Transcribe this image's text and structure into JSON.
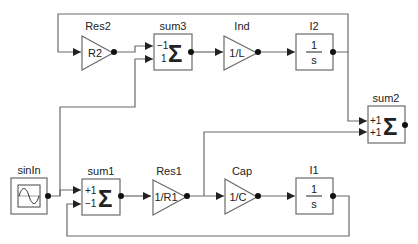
{
  "diagram": {
    "type": "block-diagram",
    "blocks": [
      {
        "id": "res2",
        "label": "Res2",
        "kind": "gain",
        "text": "R2"
      },
      {
        "id": "sum3",
        "label": "sum3",
        "kind": "sum",
        "ports": [
          "−1",
          "1"
        ],
        "symbol": "Σ"
      },
      {
        "id": "ind",
        "label": "Ind",
        "kind": "gain",
        "text": "1/L"
      },
      {
        "id": "i2",
        "label": "I2",
        "kind": "integrator",
        "num": "1",
        "den": "s"
      },
      {
        "id": "sum2",
        "label": "sum2",
        "kind": "sum",
        "ports": [
          "+1",
          "+1"
        ],
        "symbol": "Σ"
      },
      {
        "id": "sinin",
        "label": "sinIn",
        "kind": "source"
      },
      {
        "id": "sum1",
        "label": "sum1",
        "kind": "sum",
        "ports": [
          "+1",
          "−1"
        ],
        "symbol": "Σ"
      },
      {
        "id": "res1",
        "label": "Res1",
        "kind": "gain",
        "text": "1/R1"
      },
      {
        "id": "cap",
        "label": "Cap",
        "kind": "gain",
        "text": "1/C"
      },
      {
        "id": "i1",
        "label": "I1",
        "kind": "integrator",
        "num": "1",
        "den": "s"
      }
    ],
    "connections": [
      [
        "i2",
        "res2"
      ],
      [
        "res2",
        "sum3.1"
      ],
      [
        "sinin",
        "sum3.2"
      ],
      [
        "sum3",
        "ind"
      ],
      [
        "ind",
        "i2"
      ],
      [
        "i2",
        "sum2.1"
      ],
      [
        "sinin",
        "sum1.1"
      ],
      [
        "i1",
        "sum1.2"
      ],
      [
        "sum1",
        "res1"
      ],
      [
        "res1",
        "cap"
      ],
      [
        "res1",
        "sum2.2"
      ],
      [
        "cap",
        "i1"
      ]
    ],
    "colors": {
      "line": "#6b6b6b",
      "text": "#222222",
      "background": "#ffffff"
    }
  },
  "blocks": {
    "res2": {
      "label": "Res2",
      "text": "R2"
    },
    "sum3": {
      "label": "sum3",
      "p1": "−1",
      "p2": "1",
      "sym": "Σ"
    },
    "ind": {
      "label": "Ind",
      "text": "1/L"
    },
    "i2": {
      "label": "I2",
      "num": "1",
      "den": "s"
    },
    "sum2": {
      "label": "sum2",
      "p1": "+1",
      "p2": "+1",
      "sym": "Σ"
    },
    "sinin": {
      "label": "sinIn"
    },
    "sum1": {
      "label": "sum1",
      "p1": "+1",
      "p2": "−1",
      "sym": "Σ"
    },
    "res1": {
      "label": "Res1",
      "text": "1/R1"
    },
    "cap": {
      "label": "Cap",
      "text": "1/C"
    },
    "i1": {
      "label": "I1",
      "num": "1",
      "den": "s"
    }
  }
}
